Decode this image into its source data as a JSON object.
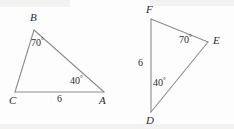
{
  "figure": {
    "background_color": "#fdfdfd",
    "stroke_color": "#8d8d8d",
    "text_color": "#2b2b2b",
    "stroke_width": 1.1
  },
  "triangle_left": {
    "name": "triangle-ABC",
    "vertices": {
      "B": {
        "label": "B",
        "x": 34,
        "y": 30
      },
      "C": {
        "label": "C",
        "x": 15,
        "y": 92
      },
      "A": {
        "label": "A",
        "x": 104,
        "y": 92
      }
    },
    "vertex_label_positions": {
      "B": {
        "x": 30,
        "y": 12
      },
      "C": {
        "x": 9,
        "y": 95
      },
      "A": {
        "x": 99,
        "y": 95
      }
    },
    "angles": [
      {
        "name": "angle-B",
        "value": "70",
        "degree": "°",
        "x": 31,
        "y": 38
      },
      {
        "name": "angle-A",
        "value": "40",
        "degree": "°",
        "x": 70,
        "y": 76
      }
    ],
    "sides": [
      {
        "name": "side-CA",
        "value": "6",
        "x": 57,
        "y": 94
      }
    ]
  },
  "triangle_right": {
    "name": "triangle-DEF",
    "vertices": {
      "F": {
        "label": "F",
        "x": 151,
        "y": 19
      },
      "E": {
        "label": "E",
        "x": 208,
        "y": 42
      },
      "D": {
        "label": "D",
        "x": 151,
        "y": 112
      }
    },
    "vertex_label_positions": {
      "F": {
        "x": 146,
        "y": 4
      },
      "E": {
        "x": 213,
        "y": 35
      },
      "D": {
        "x": 146,
        "y": 115
      }
    },
    "angles": [
      {
        "name": "angle-E",
        "value": "70",
        "degree": "°",
        "x": 179,
        "y": 35
      },
      {
        "name": "angle-D",
        "value": "40",
        "degree": "°",
        "x": 153,
        "y": 78
      }
    ],
    "sides": [
      {
        "name": "side-FD",
        "value": "6",
        "x": 138,
        "y": 58
      }
    ]
  }
}
